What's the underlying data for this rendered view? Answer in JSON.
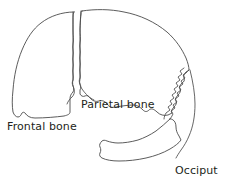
{
  "figure": {
    "kind": "anatomical-line-drawing",
    "background_color": "#ffffff",
    "stroke_color": "#4a4a4a",
    "text_color": "#231f20"
  },
  "labels": {
    "frontal": "Frontal bone",
    "parietal": "Parietal bone",
    "occiput": "Occiput"
  },
  "parts": {
    "frontal_bone": "frontal-bone-outline",
    "parietal_bone": "parietal-bone-outline",
    "occipital_bone": "occipital-bone-outline",
    "coronal_suture": "coronal-suture",
    "lambdoid_suture": "lambdoid-suture"
  }
}
